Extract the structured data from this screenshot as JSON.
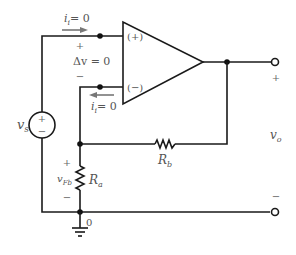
{
  "diagram": {
    "type": "non-inverting op-amp circuit",
    "opamp": {
      "plus_input_label": "(+)",
      "minus_input_label": "(−)"
    },
    "input_current_top": {
      "symbol": "i",
      "subscript": "i",
      "value": "= 0"
    },
    "input_current_bottom": {
      "symbol": "i",
      "subscript": "i",
      "value": "= 0"
    },
    "delta_v": {
      "plus": "+",
      "label": "Δv = 0",
      "minus": "−"
    },
    "source": {
      "symbol": "v",
      "subscript": "s",
      "plus": "+",
      "minus": "−"
    },
    "feedback_voltage": {
      "plus": "+",
      "symbol": "v",
      "subscript": "Fb",
      "minus": "−"
    },
    "resistor_a": {
      "symbol": "R",
      "subscript": "a"
    },
    "resistor_b": {
      "symbol": "R",
      "subscript": "b"
    },
    "output": {
      "plus": "+",
      "symbol": "v",
      "subscript": "o",
      "minus": "−"
    },
    "ground_node_label": "0"
  }
}
